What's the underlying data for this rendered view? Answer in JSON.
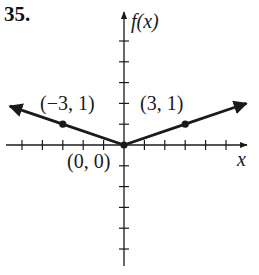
{
  "problem_number": "35.",
  "colors": {
    "ink": "#1a1a1a",
    "background": "#ffffff"
  },
  "chart_data": {
    "type": "line",
    "title": "",
    "function": "f(x) = (1/3)|x|",
    "xlabel": "x",
    "ylabel": "f(x)",
    "xlim": [
      -6,
      6
    ],
    "ylim": [
      -6,
      6
    ],
    "tick_step": 1,
    "grid": false,
    "legend": null,
    "series": [
      {
        "name": "f(x)",
        "x": [
          -5.6,
          -3,
          0,
          3,
          6.0
        ],
        "y": [
          1.87,
          1,
          0,
          1,
          2.0
        ],
        "arrows": [
          "left",
          "right"
        ]
      }
    ],
    "points": [
      {
        "x": -3,
        "y": 1,
        "label": "(−3, 1)"
      },
      {
        "x": 0,
        "y": 0,
        "label": "(0, 0)"
      },
      {
        "x": 3,
        "y": 1,
        "label": "(3, 1)"
      }
    ]
  },
  "labels": {
    "y_axis": "f(x)",
    "x_axis": "x",
    "point_left": "(−3, 1)",
    "point_origin": "(0, 0)",
    "point_right": "(3, 1)"
  }
}
